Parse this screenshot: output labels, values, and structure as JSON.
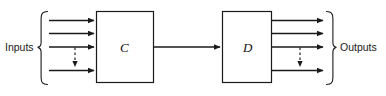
{
  "diagram": {
    "type": "block-diagram",
    "background_color": "#ffffff",
    "stroke_color": "#1a1a1a",
    "labels": {
      "inputs": "Inputs",
      "outputs": "Outputs"
    },
    "blocks": [
      {
        "id": "C",
        "label": "C",
        "x": 96,
        "y": 11,
        "width": 58,
        "height": 72,
        "input_count": 4,
        "output_count": 1
      },
      {
        "id": "D",
        "label": "D",
        "x": 222,
        "y": 11,
        "width": 50,
        "height": 72,
        "input_count": 1,
        "output_count": 4
      }
    ],
    "connections": [
      {
        "from": "inputs-brace",
        "to": "C",
        "style": "solid-arrow",
        "row": 1,
        "y": 20
      },
      {
        "from": "inputs-brace",
        "to": "C",
        "style": "solid-arrow",
        "row": 2,
        "y": 33
      },
      {
        "from": "inputs-brace",
        "to": "C",
        "style": "solid-arrow",
        "row": 3,
        "y": 47
      },
      {
        "from": "input-row-3",
        "to": "input-row-4",
        "style": "dashed-arrow",
        "orientation": "vertical",
        "x": 75
      },
      {
        "from": "inputs-brace",
        "to": "C",
        "style": "solid-arrow",
        "row": 4,
        "y": 70
      },
      {
        "from": "C",
        "to": "D",
        "style": "solid-arrow",
        "y": 47
      },
      {
        "from": "D",
        "to": "outputs-brace",
        "style": "solid-arrow",
        "row": 1,
        "y": 20
      },
      {
        "from": "D",
        "to": "outputs-brace",
        "style": "solid-arrow",
        "row": 2,
        "y": 33
      },
      {
        "from": "D",
        "to": "outputs-brace",
        "style": "solid-arrow",
        "row": 3,
        "y": 47
      },
      {
        "from": "output-row-3",
        "to": "output-row-4",
        "style": "dashed-arrow",
        "orientation": "vertical",
        "x": 300
      },
      {
        "from": "D",
        "to": "outputs-brace",
        "style": "solid-arrow",
        "row": 4,
        "y": 70
      }
    ],
    "braces": [
      {
        "id": "inputs-brace",
        "orientation": "left",
        "x": 40,
        "top": 11,
        "bottom": 85
      },
      {
        "id": "outputs-brace",
        "orientation": "right",
        "x": 333,
        "top": 11,
        "bottom": 85
      }
    ]
  }
}
